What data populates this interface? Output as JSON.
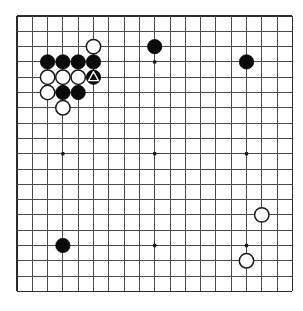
{
  "diagram": {
    "kind": "go-board-diagram",
    "board_size": 19,
    "geometry": {
      "origin_x": 17,
      "origin_y": 16,
      "spacing": 15.3,
      "stone_radius": 7.2,
      "hoshi_radius": 1.9
    },
    "colors": {
      "background": "#ffffff",
      "grid_line": "#4a4a4a",
      "grid_border": "#2b2b2b",
      "black_stone": "#0a0a0a",
      "white_stone": "#ffffff",
      "white_stone_outline": "#1a1a1a",
      "hoshi": "#1a1a1a",
      "mark_on_black": "#ffffff"
    },
    "hoshi_points": [
      {
        "col": 3,
        "row": 3
      },
      {
        "col": 9,
        "row": 3
      },
      {
        "col": 15,
        "row": 3
      },
      {
        "col": 3,
        "row": 9
      },
      {
        "col": 9,
        "row": 9
      },
      {
        "col": 15,
        "row": 9
      },
      {
        "col": 3,
        "row": 15
      },
      {
        "col": 9,
        "row": 15
      },
      {
        "col": 15,
        "row": 15
      }
    ],
    "stones": [
      {
        "id": "w-c5r2",
        "color": "white",
        "col": 5,
        "row": 2,
        "mark": null
      },
      {
        "id": "b-c2r3",
        "color": "black",
        "col": 2,
        "row": 3,
        "mark": null
      },
      {
        "id": "b-c3r3",
        "color": "black",
        "col": 3,
        "row": 3,
        "mark": null
      },
      {
        "id": "b-c4r3",
        "color": "black",
        "col": 4,
        "row": 3,
        "mark": null
      },
      {
        "id": "b-c5r3",
        "color": "black",
        "col": 5,
        "row": 3,
        "mark": null
      },
      {
        "id": "w-c2r4",
        "color": "white",
        "col": 2,
        "row": 4,
        "mark": null
      },
      {
        "id": "w-c3r4",
        "color": "white",
        "col": 3,
        "row": 4,
        "mark": null
      },
      {
        "id": "w-c4r4",
        "color": "white",
        "col": 4,
        "row": 4,
        "mark": null
      },
      {
        "id": "b-c5r4",
        "color": "black",
        "col": 5,
        "row": 4,
        "mark": "triangle"
      },
      {
        "id": "w-c2r5",
        "color": "white",
        "col": 2,
        "row": 5,
        "mark": null
      },
      {
        "id": "b-c3r5",
        "color": "black",
        "col": 3,
        "row": 5,
        "mark": null
      },
      {
        "id": "b-c4r5",
        "color": "black",
        "col": 4,
        "row": 5,
        "mark": null
      },
      {
        "id": "w-c3r6",
        "color": "white",
        "col": 3,
        "row": 6,
        "mark": null
      },
      {
        "id": "b-c9r2",
        "color": "black",
        "col": 9,
        "row": 2,
        "mark": null
      },
      {
        "id": "b-c15r3",
        "color": "black",
        "col": 15,
        "row": 3,
        "mark": null
      },
      {
        "id": "w-c16r13",
        "color": "white",
        "col": 16,
        "row": 13,
        "mark": null
      },
      {
        "id": "w-c15r16",
        "color": "white",
        "col": 15,
        "row": 16,
        "mark": null
      },
      {
        "id": "b-c3r15",
        "color": "black",
        "col": 3,
        "row": 15,
        "mark": null
      }
    ],
    "summary": {
      "black_count": 10,
      "white_count": 8,
      "marked_stone_label": "triangle-marked black stone at column 6, row 5"
    }
  }
}
